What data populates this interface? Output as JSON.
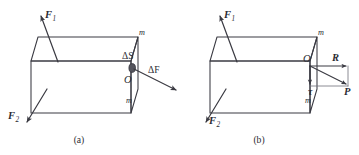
{
  "figure": {
    "panels": [
      {
        "id": "a",
        "caption": "(a)",
        "labels": {
          "force1": "F",
          "force1_sub": "1",
          "force2": "F",
          "force2_sub": "2",
          "area_element": "ΔS",
          "origin": "O",
          "delta_force": "ΔF",
          "corner_top": "m",
          "corner_bottom": "m"
        }
      },
      {
        "id": "b",
        "caption": "(b)",
        "labels": {
          "force1": "F",
          "force1_sub": "1",
          "force2": "F",
          "force2_sub": "2",
          "origin": "O",
          "normal_stress": "R",
          "shear_stress": "τ",
          "resultant": "P",
          "corner_top": "m",
          "corner_bottom": "m"
        }
      }
    ],
    "colors": {
      "line": "#3a3a42",
      "thin_line": "#6e6e78",
      "text": "#2b2b33",
      "blob": "#55555e",
      "background": "#ffffff"
    }
  }
}
